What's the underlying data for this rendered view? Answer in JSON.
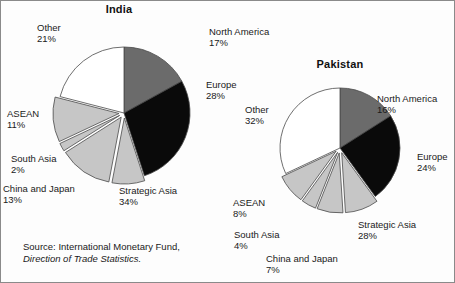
{
  "figure": {
    "source_prefix": "Source: International Monetary Fund,",
    "source_italic": "Direction of Trade Statistics."
  },
  "chart_data": [
    {
      "type": "pie",
      "title": "India",
      "labels": [
        "North America",
        "Europe",
        "Strategic Asia",
        "China and Japan",
        "South Asia",
        "ASEAN",
        "Other"
      ],
      "values": [
        17,
        28,
        34,
        13,
        2,
        11,
        21
      ],
      "value_labels": [
        "17%",
        "28%",
        "34%",
        "13%",
        "2%",
        "11%",
        "21%"
      ],
      "note": "Strategic Asia 34% is an exploded group comprising China and Japan 13%, South Asia 2%, ASEAN 11% and a remaining 8% wedge",
      "slices": [
        {
          "name": "North America",
          "pct": 17,
          "pct_label": "17%",
          "fill": "#6b6b6b",
          "exploded": false
        },
        {
          "name": "Europe",
          "pct": 28,
          "pct_label": "28%",
          "fill": "#0a0a0a",
          "exploded": false
        },
        {
          "name": "Strategic Asia",
          "pct": 8,
          "pct_label": "34%",
          "fill": "#c6c6c6",
          "exploded": true
        },
        {
          "name": "China and Japan",
          "pct": 13,
          "pct_label": "13%",
          "fill": "#c6c6c6",
          "exploded": true
        },
        {
          "name": "South Asia",
          "pct": 2,
          "pct_label": "2%",
          "fill": "#c6c6c6",
          "exploded": true
        },
        {
          "name": "ASEAN",
          "pct": 11,
          "pct_label": "11%",
          "fill": "#c6c6c6",
          "exploded": true
        },
        {
          "name": "Other",
          "pct": 21,
          "pct_label": "21%",
          "fill": "#ffffff",
          "exploded": false
        }
      ],
      "legend_position": "callout-labels",
      "grid": false
    },
    {
      "type": "pie",
      "title": "Pakistan",
      "labels": [
        "North America",
        "Europe",
        "Strategic Asia",
        "China and Japan",
        "South Asia",
        "ASEAN",
        "Other"
      ],
      "values": [
        16,
        24,
        28,
        7,
        4,
        8,
        32
      ],
      "value_labels": [
        "16%",
        "24%",
        "28%",
        "7%",
        "4%",
        "8%",
        "32%"
      ],
      "note": "Strategic Asia 28% is an exploded group comprising China and Japan 7%, South Asia 4%, ASEAN 8% and a remaining 9% wedge",
      "slices": [
        {
          "name": "North America",
          "pct": 16,
          "pct_label": "16%",
          "fill": "#6b6b6b",
          "exploded": false
        },
        {
          "name": "Europe",
          "pct": 24,
          "pct_label": "24%",
          "fill": "#0a0a0a",
          "exploded": false
        },
        {
          "name": "Strategic Asia",
          "pct": 9,
          "pct_label": "28%",
          "fill": "#c6c6c6",
          "exploded": true
        },
        {
          "name": "China and Japan",
          "pct": 7,
          "pct_label": "7%",
          "fill": "#c6c6c6",
          "exploded": true
        },
        {
          "name": "South Asia",
          "pct": 4,
          "pct_label": "4%",
          "fill": "#c6c6c6",
          "exploded": true
        },
        {
          "name": "ASEAN",
          "pct": 8,
          "pct_label": "8%",
          "fill": "#c6c6c6",
          "exploded": true
        },
        {
          "name": "Other",
          "pct": 32,
          "pct_label": "32%",
          "fill": "#ffffff",
          "exploded": false
        }
      ],
      "legend_position": "callout-labels",
      "grid": false
    }
  ],
  "india": {
    "title": "India",
    "north_america": {
      "name": "North America",
      "pct": "17%"
    },
    "europe": {
      "name": "Europe",
      "pct": "28%"
    },
    "strategic_asia": {
      "name": "Strategic Asia",
      "pct": "34%"
    },
    "china_japan": {
      "name": "China and Japan",
      "pct": "13%"
    },
    "south_asia": {
      "name": "South Asia",
      "pct": "2%"
    },
    "asean": {
      "name": "ASEAN",
      "pct": "11%"
    },
    "other": {
      "name": "Other",
      "pct": "21%"
    }
  },
  "pakistan": {
    "title": "Pakistan",
    "north_america": {
      "name": "North America",
      "pct": "16%"
    },
    "europe": {
      "name": "Europe",
      "pct": "24%"
    },
    "strategic_asia": {
      "name": "Strategic Asia",
      "pct": "28%"
    },
    "china_japan": {
      "name": "China and Japan",
      "pct": "7%"
    },
    "south_asia": {
      "name": "South Asia",
      "pct": "4%"
    },
    "asean": {
      "name": "ASEAN",
      "pct": "8%"
    },
    "other": {
      "name": "Other",
      "pct": "32%"
    }
  },
  "colors": {
    "north_america": "#6b6b6b",
    "europe": "#0a0a0a",
    "asia_group": "#c6c6c6",
    "other": "#ffffff",
    "outline": "#4a4a4a"
  }
}
